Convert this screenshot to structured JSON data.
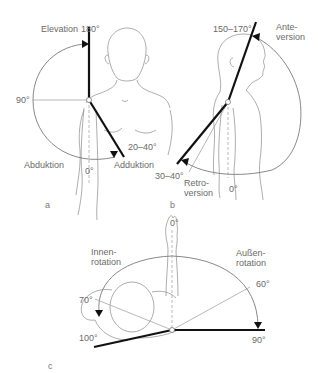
{
  "panels": {
    "a": {
      "panel_label": "a",
      "elevation_label": "Elevation",
      "elevation_value": "180°",
      "horizontal_value": "90°",
      "adduction_range": "20–40°",
      "zero_value": "0°",
      "abduction_label": "Abduktion",
      "adduction_label": "Adduktion"
    },
    "b": {
      "panel_label": "b",
      "anteversion_range": "150–170°",
      "anteversion_label_1": "Ante-",
      "anteversion_label_2": "version",
      "retroversion_range": "30–40°",
      "retroversion_label_1": "Retro-",
      "retroversion_label_2": "version",
      "zero_value": "0°"
    },
    "c": {
      "panel_label": "c",
      "zero_value": "0°",
      "internal_rotation_label_1": "Innen-",
      "internal_rotation_label_2": "rotation",
      "external_rotation_label_1": "Außen-",
      "external_rotation_label_2": "rotation",
      "value_70": "70°",
      "value_100": "100°",
      "value_60": "60°",
      "value_90": "90°"
    }
  },
  "colors": {
    "background": "#ffffff",
    "bold_line": "#111111",
    "thin_line": "#9a9a9a",
    "label_text": "#6a6a6a"
  }
}
